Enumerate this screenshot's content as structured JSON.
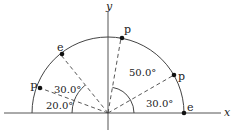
{
  "diagram": {
    "axes": {
      "x_label": "x",
      "y_label": "y"
    },
    "radius_px": 76,
    "origin_px": [
      108,
      112
    ],
    "points": [
      {
        "label": "e",
        "angle_deg": 0,
        "side": "right"
      },
      {
        "label": "p",
        "angle_deg": 30,
        "side": "right"
      },
      {
        "label": "p",
        "angle_deg": 80,
        "side": "right"
      },
      {
        "label": "e",
        "angle_deg": 130,
        "side": "left"
      },
      {
        "label": "P",
        "angle_deg": 160,
        "side": "left"
      }
    ],
    "angle_labels": {
      "right_small": "30.0°",
      "right_large": "50.0°",
      "left_small": "20.0°",
      "left_large": "30.0°"
    }
  }
}
